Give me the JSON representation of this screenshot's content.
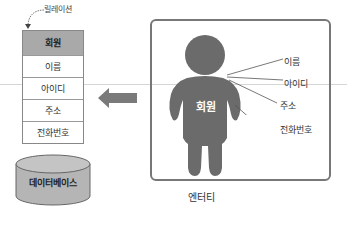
{
  "relation": {
    "label": "릴레이션",
    "header": "회원",
    "rows": [
      "이름",
      "아이디",
      "주소",
      "전화번호"
    ]
  },
  "database": {
    "label": "데이터베이스"
  },
  "entity": {
    "label": "엔터티",
    "figure_label": "회원",
    "attributes": [
      "이름",
      "아이디",
      "주소",
      "전화번호"
    ]
  },
  "colors": {
    "header_fill": "#a9a9a9",
    "figure_fill": "#6b6b6b",
    "arrow_fill": "#7a7a7a",
    "cylinder_fill": "#b5b5b5",
    "box_border": "#777777"
  }
}
